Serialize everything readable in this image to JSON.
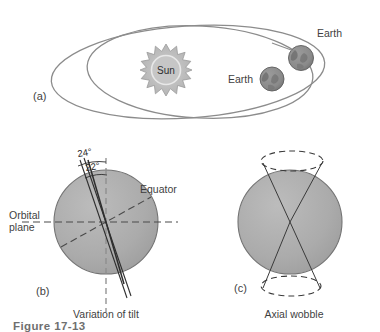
{
  "figure": {
    "number": "Figure 17-13",
    "panels": [
      {
        "id": "a",
        "label": "(a)",
        "caption": "",
        "topic": "orbital-eccentricity"
      },
      {
        "id": "b",
        "label": "(b)",
        "caption": "Variation of tilt",
        "topic": "axial-tilt"
      },
      {
        "id": "c",
        "label": "(c)",
        "caption": "Axial wobble",
        "topic": "axial-precession"
      }
    ]
  },
  "panel_a": {
    "sun_label": "Sun",
    "earth_label_outer": "Earth",
    "earth_label_inner": "Earth"
  },
  "panel_b": {
    "angle_outer": "24°",
    "angle_inner": "22°",
    "equator_label": "Equator",
    "orbital_plane_line1": "Orbital",
    "orbital_plane_line2": "plane"
  },
  "colors": {
    "globe_fill": "#aaaaaa",
    "globe_stroke": "#6f6f6f",
    "earth_fill": "#8a8a8a",
    "earth_stroke": "#5d5d5d",
    "sun_fill": "#b5b5b5",
    "sun_core": "#c9c9c9",
    "orbit_stroke": "#8c8c8c",
    "axis_stroke": "#3a3a3a",
    "dash_stroke": "#4a4a4a",
    "text": "#3f3f3f"
  }
}
